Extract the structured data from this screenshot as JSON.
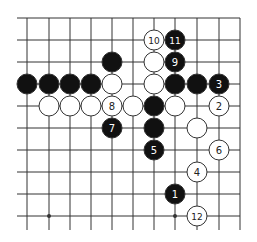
{
  "board": {
    "grid": {
      "x": [
        27,
        49,
        70,
        91,
        112,
        133,
        154,
        175,
        197,
        219
      ],
      "y": [
        18,
        40,
        62,
        84,
        106,
        128,
        150,
        172,
        194,
        216
      ],
      "right_border_x": 240,
      "line_extend_left": 17,
      "line_extend_bottom": 230,
      "line_color": "#333333"
    },
    "star_points": [
      [
        1,
        9
      ],
      [
        7,
        9
      ]
    ],
    "stone_radius": 10,
    "colors": {
      "black": "#111111",
      "white": "#ffffff",
      "stroke": "#333333"
    },
    "stones": [
      {
        "color": "white",
        "col": 6,
        "row": 1,
        "label": "10"
      },
      {
        "color": "black",
        "col": 7,
        "row": 1,
        "label": "11"
      },
      {
        "color": "black",
        "col": 4,
        "row": 2,
        "label": ""
      },
      {
        "color": "white",
        "col": 6,
        "row": 2,
        "label": ""
      },
      {
        "color": "black",
        "col": 7,
        "row": 2,
        "label": "9"
      },
      {
        "color": "black",
        "col": 0,
        "row": 3,
        "label": ""
      },
      {
        "color": "black",
        "col": 1,
        "row": 3,
        "label": ""
      },
      {
        "color": "black",
        "col": 2,
        "row": 3,
        "label": ""
      },
      {
        "color": "black",
        "col": 3,
        "row": 3,
        "label": ""
      },
      {
        "color": "white",
        "col": 4,
        "row": 3,
        "label": ""
      },
      {
        "color": "white",
        "col": 6,
        "row": 3,
        "label": ""
      },
      {
        "color": "black",
        "col": 7,
        "row": 3,
        "label": ""
      },
      {
        "color": "black",
        "col": 8,
        "row": 3,
        "label": ""
      },
      {
        "color": "black",
        "col": 9,
        "row": 3,
        "label": "3"
      },
      {
        "color": "white",
        "col": 1,
        "row": 4,
        "label": ""
      },
      {
        "color": "white",
        "col": 2,
        "row": 4,
        "label": ""
      },
      {
        "color": "white",
        "col": 3,
        "row": 4,
        "label": ""
      },
      {
        "color": "white",
        "col": 4,
        "row": 4,
        "label": "8"
      },
      {
        "color": "white",
        "col": 5,
        "row": 4,
        "label": ""
      },
      {
        "color": "black",
        "col": 6,
        "row": 4,
        "label": ""
      },
      {
        "color": "white",
        "col": 7,
        "row": 4,
        "label": ""
      },
      {
        "color": "white",
        "col": 9,
        "row": 4,
        "label": "2"
      },
      {
        "color": "black",
        "col": 4,
        "row": 5,
        "label": "7"
      },
      {
        "color": "black",
        "col": 6,
        "row": 5,
        "label": ""
      },
      {
        "color": "white",
        "col": 8,
        "row": 5,
        "label": ""
      },
      {
        "color": "black",
        "col": 6,
        "row": 6,
        "label": "5"
      },
      {
        "color": "white",
        "col": 9,
        "row": 6,
        "label": "6"
      },
      {
        "color": "white",
        "col": 8,
        "row": 7,
        "label": "4"
      },
      {
        "color": "black",
        "col": 7,
        "row": 8,
        "label": "1"
      },
      {
        "color": "white",
        "col": 8,
        "row": 9,
        "label": "12"
      }
    ]
  }
}
